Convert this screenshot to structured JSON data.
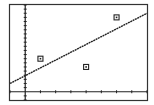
{
  "chart_data": {
    "type": "scatter",
    "title": "",
    "xlabel": "",
    "ylabel": "",
    "points": [
      {
        "x": 1,
        "y": 8
      },
      {
        "x": 4,
        "y": 6
      },
      {
        "x": 6,
        "y": 18
      }
    ],
    "regression_line": {
      "x": [
        -1,
        8
      ],
      "y": [
        2,
        19
      ]
    },
    "xlim": [
      -1,
      8
    ],
    "ylim": [
      -2,
      21
    ],
    "x_tick_step": 1,
    "y_tick_step": 1,
    "grid": false,
    "legend": null
  },
  "colors": {
    "background": "#ffffff",
    "ink": "#222222",
    "border": "#333333"
  }
}
